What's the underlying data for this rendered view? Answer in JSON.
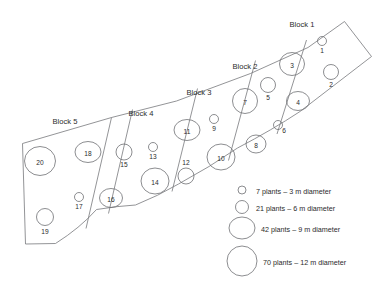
{
  "figure": {
    "type": "schematic-map"
  },
  "blocks": [
    {
      "id": "block-1",
      "label": "Block 1",
      "x": 302,
      "y": 27,
      "plots": [
        1,
        2,
        3,
        4
      ]
    },
    {
      "id": "block-2",
      "label": "Block 2",
      "x": 245,
      "y": 69,
      "plots": [
        5,
        6,
        7,
        8
      ]
    },
    {
      "id": "block-3",
      "label": "Block 3",
      "x": 199,
      "y": 95,
      "plots": [
        9,
        10,
        11,
        12
      ]
    },
    {
      "id": "block-4",
      "label": "Block 4",
      "x": 141,
      "y": 116,
      "plots": [
        13,
        14,
        15,
        16
      ]
    },
    {
      "id": "block-5",
      "label": "Block 5",
      "x": 65,
      "y": 124,
      "plots": [
        17,
        18,
        19,
        20
      ]
    }
  ],
  "plots": [
    {
      "num": "1",
      "cx": 322,
      "cy": 41,
      "rx": 4.5,
      "ry": 4.5,
      "size_class": "3m",
      "label_inside": false,
      "lx": 322,
      "ly": 53
    },
    {
      "num": "2",
      "cx": 331,
      "cy": 72,
      "rx": 7.5,
      "ry": 7.5,
      "size_class": "6m",
      "label_inside": false,
      "lx": 331,
      "ly": 87
    },
    {
      "num": "3",
      "cx": 292,
      "cy": 64,
      "rx": 12.5,
      "ry": 11.5,
      "size_class": "9m",
      "label_inside": true,
      "lx": 292,
      "ly": 66
    },
    {
      "num": "4",
      "cx": 298,
      "cy": 101,
      "rx": 11.5,
      "ry": 9.5,
      "size_class": "9m",
      "label_inside": true,
      "lx": 298,
      "ly": 103
    },
    {
      "num": "5",
      "cx": 268,
      "cy": 85,
      "rx": 7.5,
      "ry": 7.5,
      "size_class": "6m",
      "label_inside": false,
      "lx": 268,
      "ly": 100
    },
    {
      "num": "6",
      "cx": 278,
      "cy": 125,
      "rx": 4.5,
      "ry": 4.5,
      "size_class": "3m",
      "label_inside": false,
      "lx": 284,
      "ly": 133
    },
    {
      "num": "7",
      "cx": 245,
      "cy": 101,
      "rx": 12.5,
      "ry": 12.5,
      "size_class": "9m",
      "label_inside": true,
      "lx": 245,
      "ly": 103
    },
    {
      "num": "8",
      "cx": 256,
      "cy": 144,
      "rx": 10.0,
      "ry": 9.0,
      "size_class": "9m",
      "label_inside": true,
      "lx": 256,
      "ly": 146
    },
    {
      "num": "9",
      "cx": 214,
      "cy": 119,
      "rx": 4.5,
      "ry": 4.5,
      "size_class": "3m",
      "label_inside": false,
      "lx": 214,
      "ly": 131
    },
    {
      "num": "10",
      "cx": 221,
      "cy": 157,
      "rx": 14.0,
      "ry": 13.0,
      "size_class": "12m",
      "label_inside": true,
      "lx": 221,
      "ly": 159
    },
    {
      "num": "11",
      "cx": 187,
      "cy": 130,
      "rx": 13.0,
      "ry": 10.5,
      "size_class": "9m",
      "label_inside": true,
      "lx": 187,
      "ly": 132
    },
    {
      "num": "12",
      "cx": 186,
      "cy": 176,
      "rx": 8.0,
      "ry": 8.0,
      "size_class": "6m",
      "label_inside": false,
      "lx": 186,
      "ly": 165
    },
    {
      "num": "13",
      "cx": 153,
      "cy": 147,
      "rx": 4.5,
      "ry": 4.5,
      "size_class": "3m",
      "label_inside": false,
      "lx": 153,
      "ly": 159
    },
    {
      "num": "14",
      "cx": 155,
      "cy": 181,
      "rx": 14.0,
      "ry": 13.0,
      "size_class": "12m",
      "label_inside": true,
      "lx": 155,
      "ly": 183
    },
    {
      "num": "15",
      "cx": 124,
      "cy": 152,
      "rx": 8.0,
      "ry": 8.0,
      "size_class": "6m",
      "label_inside": false,
      "lx": 124,
      "ly": 167
    },
    {
      "num": "16",
      "cx": 111,
      "cy": 198,
      "rx": 11.5,
      "ry": 9.5,
      "size_class": "9m",
      "label_inside": true,
      "lx": 111,
      "ly": 200
    },
    {
      "num": "17",
      "cx": 79,
      "cy": 197,
      "rx": 4.5,
      "ry": 4.5,
      "size_class": "3m",
      "label_inside": false,
      "lx": 79,
      "ly": 209
    },
    {
      "num": "18",
      "cx": 88,
      "cy": 152,
      "rx": 13.0,
      "ry": 10.5,
      "size_class": "9m",
      "label_inside": true,
      "lx": 88,
      "ly": 154
    },
    {
      "num": "19",
      "cx": 45,
      "cy": 217,
      "rx": 8.5,
      "ry": 8.5,
      "size_class": "6m",
      "label_inside": false,
      "lx": 45,
      "ly": 234
    },
    {
      "num": "20",
      "cx": 40,
      "cy": 161,
      "rx": 15.5,
      "ry": 14.5,
      "size_class": "12m",
      "label_inside": true,
      "lx": 40,
      "ly": 163
    }
  ],
  "legend": {
    "items": [
      {
        "id": "legend-3m",
        "text": "7 plants – 3 m diameter",
        "cx": 242,
        "cy": 190,
        "r": 4.0,
        "tx": 256,
        "ty": 192
      },
      {
        "id": "legend-6m",
        "text": "21 plants – 6 m diameter",
        "cx": 242,
        "cy": 207,
        "r": 6.5,
        "tx": 256,
        "ty": 209
      },
      {
        "id": "legend-9m",
        "text": "42 plants – 9 m diameter",
        "cx": 242,
        "cy": 228,
        "rx": 13.0,
        "ry": 11.0,
        "tx": 261,
        "ty": 230
      },
      {
        "id": "legend-12m",
        "text": "70 plants – 12 m diameter",
        "cx": 242,
        "cy": 261,
        "r": 15.0,
        "tx": 263,
        "ty": 263
      }
    ]
  },
  "geometry": {
    "field_outline": "M 22.5,143.5 L 111.5,117.5 L 176.5,101.0 L 250.5,73.5 L 308.0,47.5 L 344.5,21.5 L 371.5,56.5 L 300.0,111.5 L 237.5,148.0 L 178.5,184.0 L 135.5,205.0 L 96.5,209.5 L 72.5,225.0 L 55.5,243.5 L 25.5,244.0 Z",
    "north_edge": "M 22.5,143.5 L 111.5,117.5 L 176.5,101.0 L 250.5,73.5 L 308.0,47.5 L 344.5,21.5",
    "south_edge": "M 25.5,244.0 L 55.5,243.5 Q 80,228 96.5,209.5 Q 118,206 135.5,205.0 Q 158,196 178.5,184.0 Q 210,167 237.5,148.0 Q 272,130 300.0,111.5",
    "divider_1": "M 306.5,40.0 L 277.0,134.0",
    "divider_2": "M 255.5,60.5 L 228.5,160.5",
    "divider_3": "M 197.5,88.5 L 172.0,191.5",
    "divider_4": "M 132.5,109.5 L 108.5,213.5",
    "divider_5": "M 111.5,117.5 L 86.0,228.5"
  }
}
